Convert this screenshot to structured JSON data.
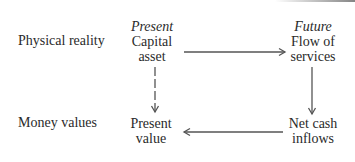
{
  "diagram": {
    "rows": {
      "physical": "Physical reality",
      "money": "Money values"
    },
    "nodes": {
      "capital_asset": {
        "timeframe": "Present",
        "lines": [
          "Capital",
          "asset"
        ]
      },
      "flow_of_services": {
        "timeframe": "Future",
        "lines": [
          "Flow of",
          "services"
        ]
      },
      "present_value": {
        "lines": [
          "Present",
          "value"
        ]
      },
      "net_cash_inflows": {
        "lines": [
          "Net cash",
          "inflows"
        ]
      }
    },
    "edges": [
      {
        "from": "capital_asset",
        "to": "flow_of_services",
        "style": "solid"
      },
      {
        "from": "flow_of_services",
        "to": "net_cash_inflows",
        "style": "solid"
      },
      {
        "from": "net_cash_inflows",
        "to": "present_value",
        "style": "solid"
      },
      {
        "from": "capital_asset",
        "to": "present_value",
        "style": "dashed"
      }
    ],
    "colors": {
      "text": "#2a2a2a",
      "arrow": "#555555",
      "background": "#ffffff"
    }
  }
}
